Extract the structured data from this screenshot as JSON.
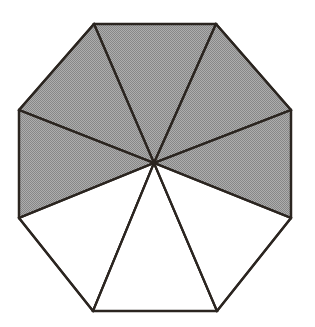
{
  "figure": {
    "kind": "geometry-diagram",
    "shape_name": "regular-octagon",
    "total_sectors": 8,
    "shaded_sectors": 5,
    "unshaded_sectors": 3,
    "shaded_fraction": "5/8",
    "unshaded_fraction": "3/8",
    "colors": {
      "background": "#ffffff",
      "shaded_fill": "#9a9a9a",
      "shaded_fill_light": "#b5b5b5",
      "unshaded_fill": "#ffffff",
      "line": "#2b2520"
    },
    "center": {
      "x": 154,
      "y": 163
    },
    "vertices": [
      {
        "id": "v-top-left",
        "x": 94,
        "y": 24
      },
      {
        "id": "v-top-right",
        "x": 216,
        "y": 24
      },
      {
        "id": "v-right-upper",
        "x": 291,
        "y": 110
      },
      {
        "id": "v-right-lower",
        "x": 291,
        "y": 218
      },
      {
        "id": "v-bottom-right",
        "x": 217,
        "y": 311
      },
      {
        "id": "v-bottom-left",
        "x": 93,
        "y": 311
      },
      {
        "id": "v-left-lower",
        "x": 19,
        "y": 218
      },
      {
        "id": "v-left-upper",
        "x": 19,
        "y": 110
      }
    ],
    "outline_points": "94,24 216,24 291,110 291,218 217,311 93,311 19,218 19,110",
    "sectors": [
      {
        "id": "sector-1",
        "name": "top-wedge",
        "shaded": true,
        "points": "154,163 94,24 216,24"
      },
      {
        "id": "sector-2",
        "name": "upper-right-wedge",
        "shaded": true,
        "points": "154,163 216,24 291,110"
      },
      {
        "id": "sector-3",
        "name": "right-wedge",
        "shaded": true,
        "points": "154,163 291,110 291,218"
      },
      {
        "id": "sector-4",
        "name": "upper-left-wedge",
        "shaded": true,
        "points": "154,163 19,110 94,24"
      },
      {
        "id": "sector-5",
        "name": "left-wedge",
        "shaded": true,
        "points": "154,163 19,218 19,110"
      },
      {
        "id": "sector-6",
        "name": "lower-left-wedge",
        "shaded": false,
        "points": "154,163 19,218 93,311"
      },
      {
        "id": "sector-7",
        "name": "bottom-wedge",
        "shaded": false,
        "points": "154,163 93,311 217,311"
      },
      {
        "id": "sector-8",
        "name": "lower-right-wedge",
        "shaded": false,
        "points": "154,163 217,311 291,218"
      }
    ],
    "spokes": [
      {
        "id": "spoke-to-top-left",
        "x2": 94,
        "y2": 24
      },
      {
        "id": "spoke-to-top-right",
        "x2": 216,
        "y2": 24
      },
      {
        "id": "spoke-to-right-upper",
        "x2": 291,
        "y2": 110
      },
      {
        "id": "spoke-to-right-lower",
        "x2": 291,
        "y2": 218
      },
      {
        "id": "spoke-to-bottom-right",
        "x2": 217,
        "y2": 311
      },
      {
        "id": "spoke-to-bottom-left",
        "x2": 93,
        "y2": 311
      },
      {
        "id": "spoke-to-left-lower",
        "x2": 19,
        "y2": 218
      },
      {
        "id": "spoke-to-left-upper",
        "x2": 19,
        "y2": 110
      }
    ]
  }
}
